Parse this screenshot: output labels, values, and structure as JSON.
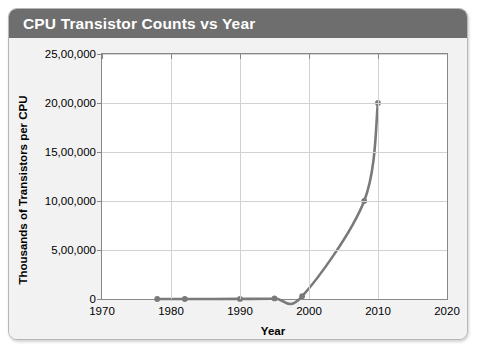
{
  "card": {
    "title": "CPU Transistor Counts vs Year",
    "title_bar_color": "#6e6e6e",
    "title_text_color": "#ffffff",
    "background_color": "#f2f2f2",
    "border_color": "#b6b6b6"
  },
  "chart_data": {
    "type": "line",
    "title": "CPU Transistor Counts vs Year",
    "xlabel": "Year",
    "ylabel": "Thousands of Transistors per CPU",
    "xlim": [
      1970,
      2020
    ],
    "ylim": [
      0,
      2500000
    ],
    "xticks": [
      1970,
      1980,
      1990,
      2000,
      2010,
      2020
    ],
    "xtick_labels": [
      "1970",
      "1980",
      "1990",
      "2000",
      "2010",
      "2020"
    ],
    "yticks": [
      0,
      500000,
      1000000,
      1500000,
      2000000,
      2500000
    ],
    "ytick_labels": [
      "0",
      "5,00,000",
      "10,00,000",
      "15,00,000",
      "20,00,000",
      "25,00,000"
    ],
    "grid": true,
    "grid_color": "#d2d2d2",
    "legend": null,
    "series": [
      {
        "name": "CPU transistor count",
        "line_color": "#7a7a7a",
        "marker": "circle",
        "marker_color": "#7a7a7a",
        "x": [
          1978,
          1982,
          1990,
          1995,
          1999,
          2008,
          2010
        ],
        "y": [
          5,
          120,
          1200,
          5500,
          28000,
          1000000,
          2000000
        ]
      }
    ]
  }
}
